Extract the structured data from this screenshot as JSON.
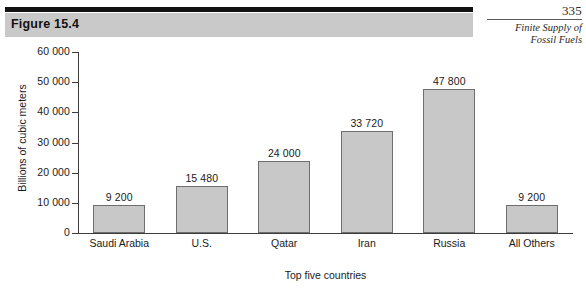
{
  "page": {
    "number": "335",
    "running_head_lines": [
      "Finite Supply of",
      "Fossil Fuels"
    ]
  },
  "figure": {
    "label": "Figure 15.4"
  },
  "chart_data": {
    "type": "bar",
    "title": "",
    "categories": [
      "Saudi Arabia",
      "U.S.",
      "Qatar",
      "Iran",
      "Russia",
      "All Others"
    ],
    "values": [
      9200,
      15480,
      24000,
      33720,
      47800,
      9200
    ],
    "value_labels": [
      "9 200",
      "15 480",
      "24 000",
      "33 720",
      "47 800",
      "9 200"
    ],
    "xlabel": "Top five countries",
    "ylabel": "Billions of cubic meters",
    "ylim": [
      0,
      60000
    ],
    "ytick_values": [
      0,
      10000,
      20000,
      30000,
      40000,
      50000,
      60000
    ],
    "ytick_labels": [
      "0",
      "10 000",
      "20 000",
      "30 000",
      "40 000",
      "50 000",
      "60 000"
    ],
    "grid": false,
    "legend": false,
    "bar_color": "#c8c8c8",
    "bar_border_color": "#6e6e6e",
    "axis_color": "#3d3d3d"
  }
}
